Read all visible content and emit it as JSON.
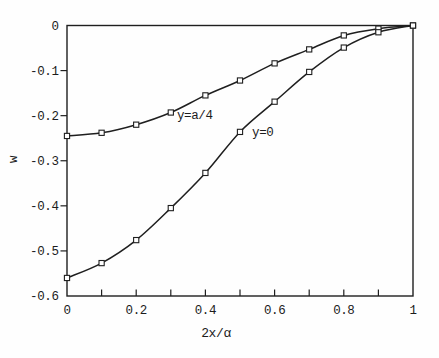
{
  "figure": {
    "background": "#fefefe",
    "ink_color": "#1f1f1f"
  },
  "chart_data": {
    "type": "line",
    "title": "",
    "xlabel": "2x/α",
    "ylabel": "w",
    "xlim": [
      0,
      1
    ],
    "ylim": [
      -0.6,
      0
    ],
    "grid": false,
    "legend": "none (curves labeled inline)",
    "x_tick_marks": [
      0.1,
      0.2,
      0.3,
      0.4,
      0.5,
      0.6,
      0.7,
      0.8,
      0.9
    ],
    "x_tick_labels": [
      {
        "value": 0,
        "label": "0"
      },
      {
        "value": 0.2,
        "label": "0.2"
      },
      {
        "value": 0.4,
        "label": "0.4"
      },
      {
        "value": 0.6,
        "label": "0.6"
      },
      {
        "value": 0.8,
        "label": "0.8"
      },
      {
        "value": 1,
        "label": "1"
      }
    ],
    "y_tick_marks": [
      -0.1,
      -0.2,
      -0.3,
      -0.4,
      -0.5
    ],
    "y_tick_labels": [
      {
        "value": 0,
        "label": "0"
      },
      {
        "value": -0.1,
        "label": "-0.1"
      },
      {
        "value": -0.2,
        "label": "-0.2"
      },
      {
        "value": -0.3,
        "label": "-0.3"
      },
      {
        "value": -0.4,
        "label": "-0.4"
      },
      {
        "value": -0.5,
        "label": "-0.5"
      },
      {
        "value": -0.6,
        "label": "-0.6"
      }
    ],
    "x": [
      0,
      0.1,
      0.2,
      0.3,
      0.4,
      0.5,
      0.6,
      0.7,
      0.8,
      0.9,
      1.0
    ],
    "series": [
      {
        "name": "y=a/4",
        "marker": "open-square",
        "values": [
          -0.245,
          -0.238,
          -0.22,
          -0.193,
          -0.155,
          -0.122,
          -0.084,
          -0.053,
          -0.022,
          -0.007,
          0.0
        ]
      },
      {
        "name": "y=0",
        "marker": "open-square",
        "values": [
          -0.56,
          -0.527,
          -0.476,
          -0.405,
          -0.327,
          -0.236,
          -0.169,
          -0.103,
          -0.049,
          -0.015,
          0.0
        ]
      }
    ],
    "annotations": [
      {
        "text": "y=a/4",
        "x": 0.318,
        "y": -0.207
      },
      {
        "text": "y=0",
        "x": 0.535,
        "y": -0.245
      }
    ]
  }
}
